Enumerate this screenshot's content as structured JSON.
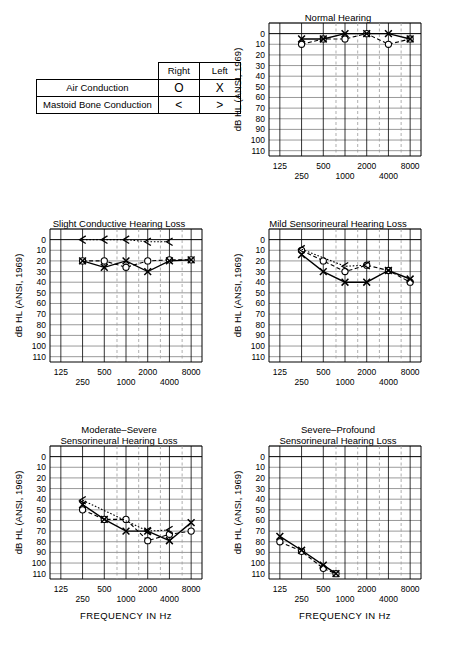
{
  "legend": {
    "col_headers": [
      "Right",
      "Left"
    ],
    "rows": [
      {
        "label": "Air Conduction",
        "right": "O",
        "left": "X"
      },
      {
        "label": "Mastoid Bone Conduction",
        "right": "<",
        "left": ">"
      }
    ]
  },
  "axis": {
    "ylabel": "dB HL (ANSI, 1969)",
    "xlabel": "FREQUENCY IN Hz",
    "yticks": [
      0,
      10,
      20,
      30,
      40,
      50,
      60,
      70,
      80,
      90,
      100,
      110
    ],
    "ylim": [
      -10,
      115
    ],
    "xticks_upper": [
      "125",
      "500",
      "2000",
      "8000"
    ],
    "xticks_lower": [
      "250",
      "1000",
      "4000"
    ],
    "x_octaves": [
      125,
      250,
      500,
      1000,
      2000,
      4000,
      8000
    ],
    "x_interoctaves": [
      750,
      1500,
      3000,
      6000
    ]
  },
  "chart_data": [
    {
      "id": "normal-hearing",
      "type": "line",
      "title": "Normal Hearing",
      "title_lines": [
        "Normal Hearing"
      ],
      "xlabel": "",
      "ylabel": "dB HL (ANSI, 1969)",
      "ylim": [
        -10,
        115
      ],
      "grid": true,
      "series": [
        {
          "name": "Right Air Conduction",
          "symbol": "O",
          "style": "dashed",
          "x": [
            250,
            500,
            1000,
            2000,
            4000,
            8000
          ],
          "values": [
            10,
            5,
            5,
            0,
            10,
            5
          ]
        },
        {
          "name": "Left Air Conduction",
          "symbol": "X",
          "style": "solid",
          "x": [
            250,
            500,
            1000,
            2000,
            4000,
            8000
          ],
          "values": [
            5,
            5,
            0,
            0,
            0,
            5
          ]
        }
      ]
    },
    {
      "id": "slight-conductive",
      "type": "line",
      "title": "Slight Conductive Hearing Loss",
      "title_lines": [
        "Slight Conductive Hearing Loss"
      ],
      "xlabel": "",
      "ylabel": "dB HL (ANSI, 1969)",
      "ylim": [
        -10,
        115
      ],
      "grid": true,
      "series": [
        {
          "name": "Right Air Conduction",
          "symbol": "O",
          "style": "dashed",
          "x": [
            250,
            500,
            1000,
            2000,
            4000,
            8000
          ],
          "values": [
            20,
            20,
            26,
            20,
            19,
            19
          ]
        },
        {
          "name": "Left Air Conduction",
          "symbol": "X",
          "style": "solid",
          "x": [
            250,
            500,
            1000,
            2000,
            4000,
            8000
          ],
          "values": [
            20,
            26,
            20,
            30,
            20,
            19
          ]
        },
        {
          "name": "Right Bone Conduction",
          "symbol": "<",
          "style": "dotted",
          "x": [
            250,
            500,
            1000,
            2000,
            4000
          ],
          "values": [
            0,
            0,
            0,
            2,
            2
          ]
        }
      ]
    },
    {
      "id": "mild-sensorineural",
      "type": "line",
      "title": "Mild Sensorineural Hearing Loss",
      "title_lines": [
        "Mild Sensorineural Hearing Loss"
      ],
      "xlabel": "",
      "ylabel": "dB HL (ANSI, 1969)",
      "ylim": [
        -10,
        115
      ],
      "grid": true,
      "series": [
        {
          "name": "Right Air Conduction",
          "symbol": "O",
          "style": "dashed",
          "x": [
            250,
            500,
            1000,
            2000,
            4000,
            8000
          ],
          "values": [
            10,
            20,
            30,
            24,
            29,
            40
          ]
        },
        {
          "name": "Left Air Conduction",
          "symbol": "X",
          "style": "solid",
          "x": [
            250,
            500,
            1000,
            2000,
            4000,
            8000
          ],
          "values": [
            14,
            30,
            40,
            40,
            29,
            37
          ]
        },
        {
          "name": "Right Bone Conduction",
          "symbol": "<",
          "style": "dotted",
          "x": [
            250,
            1000,
            2000
          ],
          "values": [
            9,
            25,
            24
          ]
        }
      ]
    },
    {
      "id": "moderate-severe-sensorineural",
      "type": "line",
      "title": "Moderate-Severe Sensorineural Hearing Loss",
      "title_lines": [
        "Moderate–Severe",
        "Sensorineural Hearing Loss"
      ],
      "xlabel": "FREQUENCY IN Hz",
      "ylabel": "dB HL (ANSI, 1969)",
      "ylim": [
        -10,
        115
      ],
      "grid": true,
      "series": [
        {
          "name": "Right Air Conduction",
          "symbol": "O",
          "style": "dashed",
          "x": [
            250,
            500,
            1000,
            2000,
            4000,
            8000
          ],
          "values": [
            50,
            59,
            59,
            79,
            73,
            70
          ]
        },
        {
          "name": "Left Air Conduction",
          "symbol": "X",
          "style": "solid",
          "x": [
            250,
            500,
            1000,
            2000,
            4000,
            8000
          ],
          "values": [
            45,
            59,
            70,
            70,
            79,
            62
          ]
        },
        {
          "name": "Right Bone Conduction",
          "symbol": "<",
          "style": "dotted",
          "x": [
            250,
            2000,
            4000
          ],
          "values": [
            41,
            70,
            69
          ]
        }
      ]
    },
    {
      "id": "severe-profound-sensorineural",
      "type": "line",
      "title": "Severe-Profound Sensorineural Hearing Loss",
      "title_lines": [
        "Severe–Profound",
        "Sensorineural Hearing Loss"
      ],
      "xlabel": "FREQUENCY IN Hz",
      "ylabel": "dB HL (ANSI, 1969)",
      "ylim": [
        -10,
        115
      ],
      "grid": true,
      "series": [
        {
          "name": "Right Air Conduction",
          "symbol": "O",
          "style": "dashed",
          "x": [
            125,
            250,
            500,
            750
          ],
          "values": [
            80,
            89,
            105,
            110
          ]
        },
        {
          "name": "Left Air Conduction",
          "symbol": "X",
          "style": "solid",
          "x": [
            125,
            250,
            500,
            750
          ],
          "values": [
            75,
            88,
            102,
            110
          ]
        }
      ]
    }
  ],
  "colors": {
    "ink": "#000000",
    "grid_major": "#000000",
    "grid_minor": "#9a9a9a",
    "background": "#ffffff"
  }
}
